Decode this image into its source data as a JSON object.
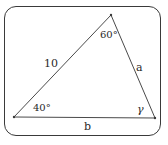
{
  "diagram": {
    "type": "triangle",
    "vertices": {
      "top": {
        "x": 111,
        "y": 15
      },
      "bottom_left": {
        "x": 14,
        "y": 117
      },
      "bottom_right": {
        "x": 155,
        "y": 118
      }
    },
    "sides": {
      "left": {
        "label": "10"
      },
      "right": {
        "label": "a"
      },
      "bottom": {
        "label": "b"
      }
    },
    "angles": {
      "top": {
        "label": "60°"
      },
      "bottom_left": {
        "label": "40°"
      },
      "bottom_right": {
        "label": "γ"
      }
    },
    "colors": {
      "stroke": "#3a3a3a",
      "text": "#2a2a2a",
      "background": "#ffffff"
    }
  }
}
